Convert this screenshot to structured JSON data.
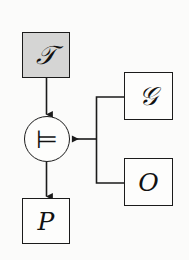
{
  "diagram": {
    "background_color": "#fbfbfa",
    "line_color": "#1b1b1b",
    "shaded_fill": "#d5d5d4",
    "plain_fill": "#fdfdfc",
    "nodes": {
      "trace": {
        "label": "𝒯",
        "plain_label": "T",
        "shape": "rectangle",
        "fill": "shaded",
        "x": 22,
        "y": 32,
        "w": 48,
        "h": 46
      },
      "operator": {
        "label": "⊨",
        "plain_label": "models",
        "shape": "circle",
        "fill": "plain",
        "cx": 47,
        "cy": 139,
        "r": 23
      },
      "goal": {
        "label": "𝒢",
        "plain_label": "G",
        "shape": "rectangle",
        "fill": "plain",
        "x": 124,
        "y": 72,
        "w": 49,
        "h": 48
      },
      "observation": {
        "label": "O",
        "plain_label": "O",
        "shape": "rectangle",
        "fill": "plain",
        "x": 124,
        "y": 158,
        "w": 49,
        "h": 48
      },
      "result": {
        "label": "P",
        "plain_label": "P",
        "shape": "rectangle",
        "fill": "plain",
        "x": 22,
        "y": 198,
        "w": 48,
        "h": 46
      }
    },
    "edges": [
      {
        "name": "trace-to-operator",
        "from": "trace",
        "to": "operator",
        "arrow": "down"
      },
      {
        "name": "operator-to-result",
        "from": "operator",
        "to": "result",
        "arrow": "down"
      },
      {
        "name": "goal-to-operator",
        "from": "goal",
        "to": "operator",
        "arrow": "left"
      },
      {
        "name": "observation-to-operator",
        "from": "observation",
        "to": "operator",
        "arrow": "left"
      }
    ]
  }
}
